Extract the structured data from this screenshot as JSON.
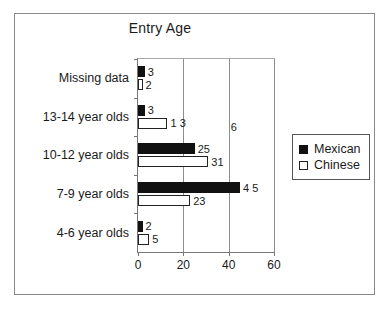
{
  "chart_data": {
    "type": "bar",
    "orientation": "horizontal",
    "title": "Entry Age",
    "xlabel": "",
    "ylabel": "",
    "xlim": [
      0,
      60
    ],
    "xticks": [
      0,
      20,
      40,
      60
    ],
    "xtick_labels": [
      "0",
      "20",
      "40",
      "60"
    ],
    "grid": true,
    "legend_position": "right",
    "categories": [
      "4-6 year olds",
      "7-9 year olds",
      "10-12 year olds",
      "13-14 year olds",
      "Missing data"
    ],
    "series": [
      {
        "name": "Mexican",
        "color": "#111111",
        "fill": "solid",
        "values": [
          2,
          45,
          25,
          3,
          3
        ],
        "value_labels": [
          "2",
          "4 5",
          "25",
          "3",
          "3"
        ]
      },
      {
        "name": "Chinese",
        "color": "#ffffff",
        "fill": "hollow",
        "values": [
          5,
          23,
          31,
          13,
          2
        ],
        "value_labels": [
          "5",
          "23",
          "31",
          "1 3",
          "2"
        ]
      }
    ],
    "annotations": [
      {
        "text": "6",
        "x": 40,
        "category": "13-14 year olds"
      }
    ]
  },
  "legend": {
    "items": [
      {
        "label": "Mexican",
        "swatch": "filled-square-icon"
      },
      {
        "label": "Chinese",
        "swatch": "hollow-square-icon"
      }
    ]
  }
}
